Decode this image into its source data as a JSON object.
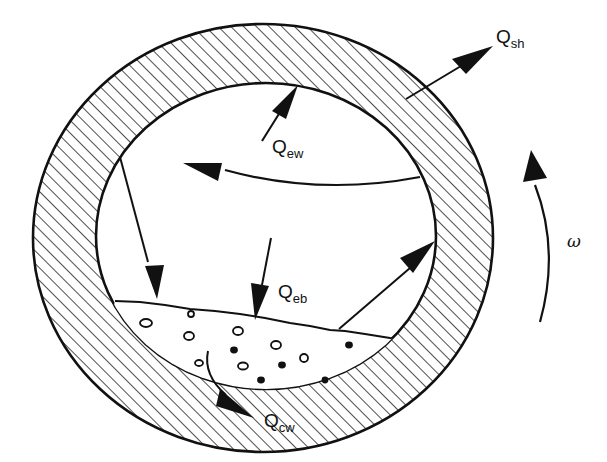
{
  "figure": {
    "colors": {
      "line": "#111111",
      "background": "#ffffff",
      "hatch": "#222222"
    }
  },
  "labels": {
    "q_sh": {
      "main": "Q",
      "sub": "sh"
    },
    "q_ew": {
      "main": "Q",
      "sub": "ew"
    },
    "q_eb": {
      "main": "Q",
      "sub": "eb"
    },
    "q_cw": {
      "main": "Q",
      "sub": "cw"
    },
    "omega": "ω"
  }
}
